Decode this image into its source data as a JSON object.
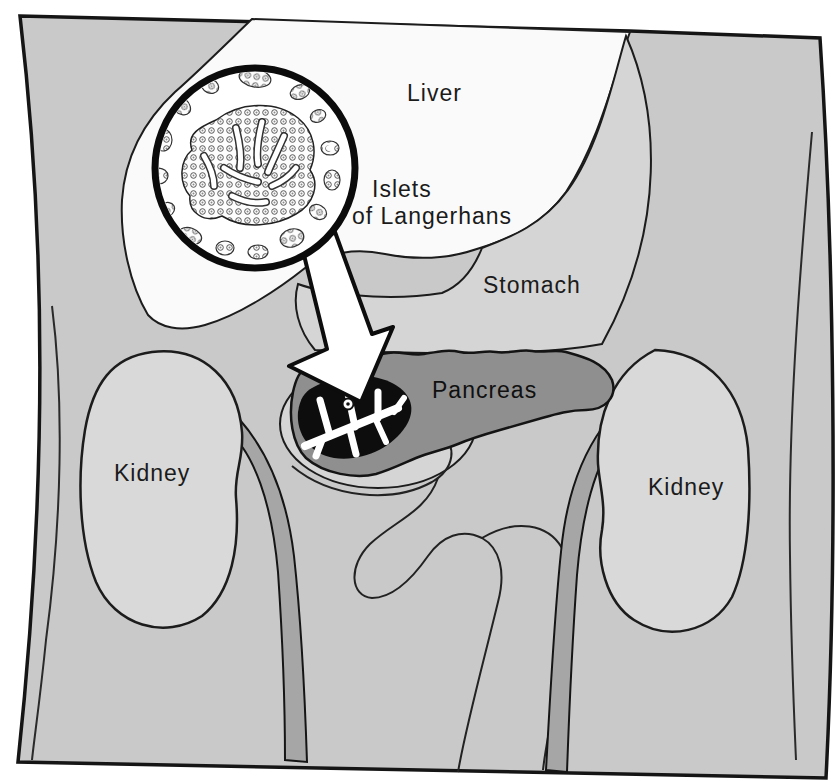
{
  "diagram": {
    "type": "anatomical-illustration",
    "labels": {
      "liver": "Liver",
      "islets_line1": "Islets",
      "islets_line2": "of Langerhans",
      "stomach": "Stomach",
      "pancreas": "Pancreas",
      "kidney_left": "Kidney",
      "kidney_right": "Kidney"
    }
  },
  "colors": {
    "background": "#ffffff",
    "body": "#c9c9c9",
    "organ_light": "#d5d5d5",
    "kidney": "#d9d9d9",
    "liver": "#fafafa",
    "pancreas": "#8f8f8f",
    "ureter": "#a6a6a6",
    "outline": "#161616",
    "cutaway": "#0d0d0d",
    "highlight": "#ffffff"
  }
}
